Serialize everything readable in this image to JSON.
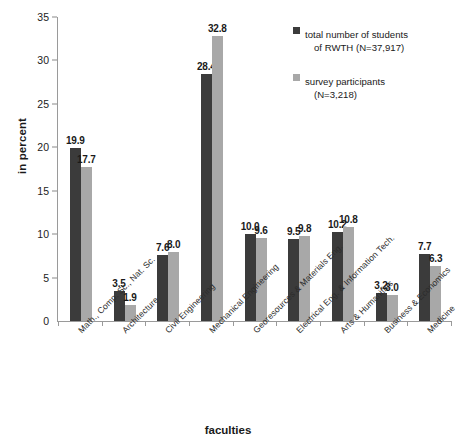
{
  "chart_data": {
    "type": "bar",
    "title": "",
    "xlabel": "faculties",
    "ylabel": "in percent",
    "ylim": [
      0,
      35
    ],
    "yticks": [
      0,
      5,
      10,
      15,
      20,
      25,
      30,
      35
    ],
    "grid": false,
    "legend_position": "top-right",
    "categories": [
      "Math., Comp. Sc., Nat. Sc.",
      "Architecture",
      "Civil Engineering",
      "Mechanical Engineering",
      "Georesources & Materials Eng.",
      "Electrical Eng. & Information Tech.",
      "Arts & Humanities",
      "Business & Economics",
      "Medicine"
    ],
    "series": [
      {
        "name": "total number of students of RWTH (N=37,917)",
        "color": "#3b3b3b",
        "values": [
          19.9,
          3.5,
          7.6,
          28.4,
          10.0,
          9.5,
          10.2,
          3.2,
          7.7
        ]
      },
      {
        "name": "survey participants (N=3,218)",
        "color": "#a8a8a8",
        "values": [
          17.7,
          1.9,
          8.0,
          32.8,
          9.6,
          9.8,
          10.8,
          3.0,
          6.3
        ]
      }
    ]
  },
  "legend": {
    "entries": [
      {
        "line1": "total number of students",
        "line2": "of RWTH (N=37,917)"
      },
      {
        "line1": "survey participants",
        "line2": "(N=3,218)"
      }
    ]
  },
  "axes": {
    "y_title": "in percent",
    "x_title": "faculties",
    "y_tick_labels": [
      "0",
      "5",
      "10",
      "15",
      "20",
      "25",
      "30",
      "35"
    ]
  }
}
